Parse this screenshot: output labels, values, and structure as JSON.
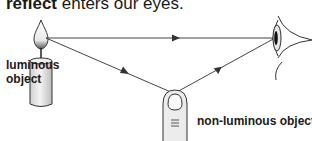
{
  "caption": {
    "bold_part": "reflect",
    "rest": " enters our eyes."
  },
  "labels": {
    "luminous": "luminous object",
    "non_luminous": "non-luminous object"
  },
  "diagram": {
    "elements": [
      "candle (luminous object)",
      "finger (non-luminous object)",
      "eye"
    ],
    "rays": [
      {
        "from": "candle flame",
        "to": "eye",
        "type": "direct"
      },
      {
        "from": "candle flame",
        "to": "finger",
        "type": "incident"
      },
      {
        "from": "finger",
        "to": "eye",
        "type": "reflected"
      }
    ]
  }
}
